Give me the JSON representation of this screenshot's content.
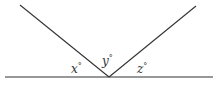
{
  "diagram": {
    "type": "angles-on-a-straight-line",
    "stroke_color": "#333333",
    "labels": {
      "x": "x",
      "y": "y",
      "z": "z",
      "degree": "°"
    }
  }
}
